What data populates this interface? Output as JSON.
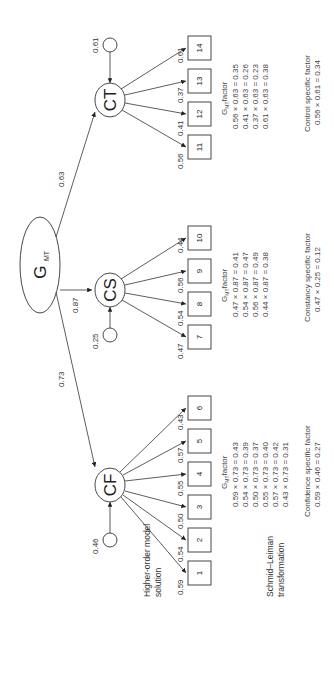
{
  "diagram": {
    "orientation": "rotated-90-ccw",
    "general_factor": {
      "label": "G",
      "subscript": "MT"
    },
    "first_order_factors": [
      {
        "id": "CF",
        "label": "CF",
        "loading_from_g": "0.73",
        "residual": "0.46",
        "items": [
          {
            "id": "1",
            "loading": "0.59"
          },
          {
            "id": "2",
            "loading": "0.54"
          },
          {
            "id": "3",
            "loading": "0.50"
          },
          {
            "id": "4",
            "loading": "0.55"
          },
          {
            "id": "5",
            "loading": "0.57"
          },
          {
            "id": "6",
            "loading": "0.43"
          }
        ],
        "gmt_header": "factor",
        "gmt_calcs": [
          "0.59 × 0.73 = 0.43",
          "0.54 × 0.73 = 0.39",
          "0.50 × 0.73 = 0.37",
          "0.55 × 0.73 = 0.40",
          "0.57 × 0.73 = 0.42",
          "0.43 × 0.73 = 0.31"
        ],
        "specific_title": "Confidence specific factor",
        "specific_calc": "0.59 × 0.46 = 0.27"
      },
      {
        "id": "CS",
        "label": "CS",
        "loading_from_g": "0.87",
        "residual": "0.25",
        "items": [
          {
            "id": "7",
            "loading": "0.47"
          },
          {
            "id": "8",
            "loading": "0.54"
          },
          {
            "id": "9",
            "loading": "0.56"
          },
          {
            "id": "10",
            "loading": "0.44"
          }
        ],
        "gmt_header": "factor",
        "gmt_calcs": [
          "0.47 × 0.87 = 0.41",
          "0.54 × 0.87 = 0.47",
          "0.56 × 0.87 = 0.49",
          "0.44 × 0.87 = 0.38"
        ],
        "specific_title": "Constancy specific factor",
        "specific_calc": "0.47 × 0.25 = 0.12"
      },
      {
        "id": "CT",
        "label": "CT",
        "loading_from_g": "0.63",
        "residual": "0.61",
        "items": [
          {
            "id": "11",
            "loading": "0.56"
          },
          {
            "id": "12",
            "loading": "0.41"
          },
          {
            "id": "13",
            "loading": "0.37"
          },
          {
            "id": "14",
            "loading": "0.61"
          }
        ],
        "gmt_header": "factor",
        "gmt_calcs": [
          "0.56 × 0.63 = 0.35",
          "0.41 × 0.63 = 0.26",
          "0.37 × 0.63 = 0.23",
          "0.61 × 0.63 = 0.38"
        ],
        "specific_title": "Control specific factor",
        "specific_calc": "0.56 × 0.61 = 0.34"
      }
    ],
    "row_labels": {
      "higher_order_line1": "Higher-order model",
      "higher_order_line2": "solution",
      "schmid_line1": "Schmid–Leiman",
      "schmid_line2": "transformation"
    }
  }
}
